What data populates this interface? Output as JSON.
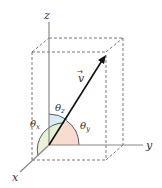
{
  "diagram": {
    "type": "3d-vector-direction-angles",
    "axes": {
      "x_label": "x",
      "y_label": "y",
      "z_label": "z"
    },
    "vector": {
      "label": "v",
      "arrow_accent": "→"
    },
    "angles": {
      "theta_x": {
        "symbol": "θ",
        "subscript": "x",
        "color": "#e8f0d0"
      },
      "theta_y": {
        "symbol": "θ",
        "subscript": "y",
        "color": "#f8dcd0"
      },
      "theta_z": {
        "symbol": "θ",
        "subscript": "z",
        "color": "#d8ecf4"
      }
    },
    "colors": {
      "axis": "#888888",
      "vector": "#111111",
      "box_dashes": "#555555"
    }
  }
}
